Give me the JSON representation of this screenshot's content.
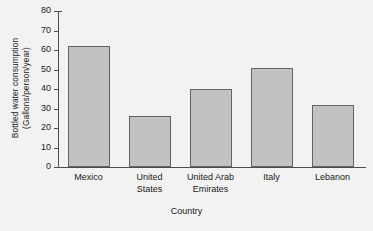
{
  "chart_data": {
    "type": "bar",
    "title": "",
    "subtitle": "",
    "xlabel": "Country",
    "ylabel": "Bottled water consumption (Gallons/person/year)",
    "ylabel_line1": "Bottled water consumption",
    "ylabel_line2": "(Gallons/person/year)",
    "categories": [
      "Mexico",
      "United States",
      "United Arab Emirates",
      "Italy",
      "Lebanon"
    ],
    "values": [
      62,
      26,
      40,
      51,
      32
    ],
    "ylim": [
      0,
      80
    ],
    "yticks": [
      0,
      10,
      20,
      30,
      40,
      50,
      60,
      70,
      80
    ],
    "ytick_labels": [
      "0",
      "10",
      "20",
      "30",
      "40",
      "50",
      "60",
      "70",
      "80"
    ],
    "grid": false,
    "legend": null,
    "legend_position": "none",
    "bar_fill_color": "#c2c2c2",
    "bar_edge_color": "#636363",
    "axis_color": "#4d4d4d",
    "background_color": "#f2f2f2"
  },
  "categories_display": [
    "Mexico",
    "United\nStates",
    "United Arab\nEmirates",
    "Italy",
    "Lebanon"
  ]
}
